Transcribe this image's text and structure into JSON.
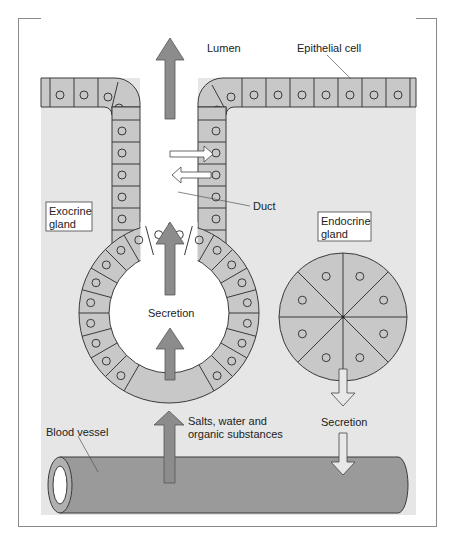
{
  "diagram": {
    "labels": {
      "lumen": "Lumen",
      "epithelial_cell": "Epithelial cell",
      "duct": "Duct",
      "exocrine_gland_line1": "Exocrine",
      "exocrine_gland_line2": "gland",
      "endocrine_gland_line1": "Endocrine",
      "endocrine_gland_line2": "gland",
      "secretion_exocrine": "Secretion",
      "secretion_endocrine": "Secretion",
      "salts_line1": "Salts, water and",
      "salts_line2": "organic substances",
      "blood_vessel": "Blood vessel"
    },
    "colors": {
      "frame_border": "#8a8a8a",
      "background_panel": "#e6e6e6",
      "cell_fill": "#c8c8c8",
      "cell_stroke": "#3a3a3a",
      "lumen_fill": "#ffffff",
      "dark_arrow": "#8c8c8c",
      "light_arrow": "#e8e8e8",
      "blood_vessel": "#9a9a9a"
    },
    "exocrine": {
      "acinus_cells": 24,
      "duct_cells_per_side": 7
    },
    "endocrine": {
      "segments": 8
    }
  }
}
